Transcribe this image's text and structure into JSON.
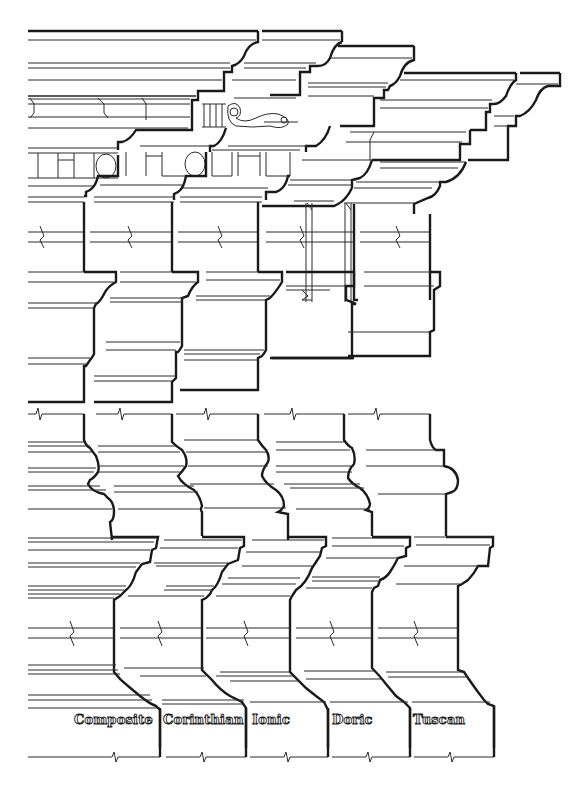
{
  "orders": [
    {
      "id": "composite",
      "label": "Composite"
    },
    {
      "id": "corinthian",
      "label": "Corinthian"
    },
    {
      "id": "ionic",
      "label": "Ionic"
    },
    {
      "id": "doric",
      "label": "Doric"
    },
    {
      "id": "tuscan",
      "label": "Tuscan"
    }
  ],
  "sections": [
    {
      "id": "entablature",
      "description": "Cornice, frieze and architrave profiles, stepped back by order"
    },
    {
      "id": "capital",
      "description": "Capital / impost profiles"
    },
    {
      "id": "column-base",
      "description": "Attic and Tuscan base profiles"
    },
    {
      "id": "pedestal",
      "description": "Pedestal cap (cornice) and base moldings"
    }
  ],
  "ornaments": {
    "modillion": "scroll modillion (Composite/Corinthian cornice)",
    "dentils": "dentil blocks with egg ovals",
    "mutules": "Doric mutule / triglyph guttae"
  },
  "colors": {
    "ink": "#1a1a1a",
    "paper": "#ffffff"
  }
}
